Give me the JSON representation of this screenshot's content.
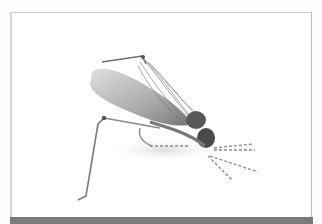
{
  "image": {
    "subject": "fly-fishing hopper lure",
    "background_color": "#ffffff",
    "frame_color": "#cfcfcf",
    "bar_color": "#7a7a7a"
  }
}
